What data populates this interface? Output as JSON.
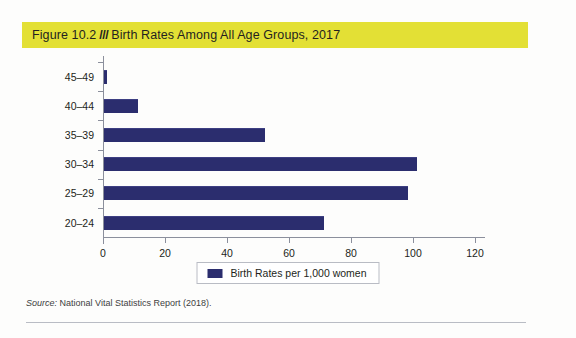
{
  "figure": {
    "label": "Figure 10.2",
    "separator": "///",
    "title": "Birth Rates Among All Age Groups, 2017",
    "band_color": "#e3e035"
  },
  "source": {
    "prefix": "Source:",
    "text": "National Vital Statistics Report (2018)."
  },
  "legend": {
    "label": "Birth Rates per 1,000 women",
    "swatch_color": "#2b2d6e"
  },
  "chart_data": {
    "type": "bar",
    "orientation": "horizontal",
    "title": "Birth Rates Among All Age Groups, 2017",
    "xlabel": "",
    "ylabel": "",
    "categories": [
      "45–49",
      "40–44",
      "35–39",
      "30–34",
      "25–29",
      "20–24"
    ],
    "values": [
      1,
      11,
      52,
      101,
      98,
      71
    ],
    "series": [
      {
        "name": "Birth Rates per 1,000 women",
        "color": "#2b2d6e",
        "values": [
          1,
          11,
          52,
          101,
          98,
          71
        ]
      }
    ],
    "xlim": [
      0,
      120
    ],
    "xticks": [
      0,
      20,
      40,
      60,
      80,
      100,
      120
    ],
    "xtick_labels": [
      "0",
      "20",
      "40",
      "60",
      "80",
      "100",
      "120"
    ],
    "grid": false,
    "legend_position": "bottom"
  }
}
